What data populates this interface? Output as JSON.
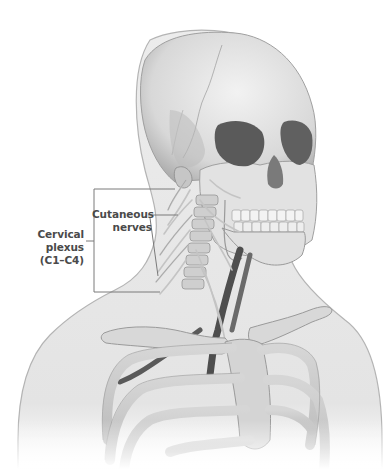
{
  "figure": {
    "labels": {
      "cervical_plexus": {
        "line1": "Cervical",
        "line2": "plexus",
        "line3": "(C1–C4)"
      },
      "cutaneous_nerves": {
        "line1": "Cutaneous",
        "line2": "nerves"
      }
    },
    "colors": {
      "skin": "#e8e8e8",
      "skin_outline": "#b4b4b4",
      "bone": "#dcdcdc",
      "bone_shadow": "#9a9a9a",
      "orbit": "#5a5a5a",
      "vessel": "#4e4e4e",
      "nerve": "#c8c8c8",
      "leader_line": "#7a7a7a",
      "label_text": "#4a4a4a"
    }
  }
}
